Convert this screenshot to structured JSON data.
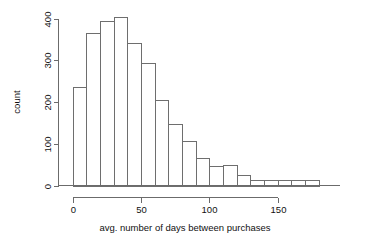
{
  "chart_data": {
    "type": "bar",
    "title": "",
    "subtitle": "",
    "xlabel": "avg. number of days between purchases",
    "ylabel": "count",
    "xlim": [
      0,
      185
    ],
    "ylim": [
      0,
      410
    ],
    "grid": false,
    "legend": null,
    "bin_width": 10,
    "x_ticks": [
      0,
      50,
      100,
      150
    ],
    "x_tick_labels": [
      "0",
      "50",
      "100",
      "150"
    ],
    "y_ticks": [
      0,
      100,
      200,
      300,
      400
    ],
    "y_tick_labels": [
      "0",
      "100",
      "200",
      "300",
      "400"
    ],
    "categories": [
      "0-10",
      "10-20",
      "20-30",
      "30-40",
      "40-50",
      "50-60",
      "60-70",
      "70-80",
      "80-90",
      "90-100",
      "100-110",
      "110-120",
      "120-130",
      "130-140",
      "140-150",
      "150-160",
      "160-170",
      "170-180"
    ],
    "bin_edges": [
      0,
      10,
      20,
      30,
      40,
      50,
      60,
      70,
      80,
      90,
      100,
      110,
      120,
      130,
      140,
      150,
      160,
      170,
      180
    ],
    "values": [
      237,
      365,
      395,
      404,
      341,
      294,
      204,
      147,
      107,
      67,
      47,
      48,
      25,
      12,
      13,
      13,
      12,
      14
    ],
    "series": [
      {
        "name": "count",
        "values": [
          237,
          365,
          395,
          404,
          341,
          294,
          204,
          147,
          107,
          67,
          47,
          48,
          25,
          12,
          13,
          13,
          12,
          14
        ]
      }
    ],
    "colors": {
      "bar_fill": "#ffffff",
      "bar_stroke": "#6e6e6e",
      "axis": "#6b6b6b",
      "text": "#111111",
      "background": "#ffffff"
    }
  }
}
